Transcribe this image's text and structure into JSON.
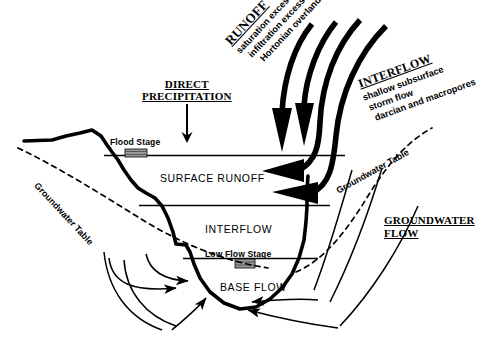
{
  "figure": {
    "colors": {
      "ink": "#000000",
      "background": "#ffffff",
      "marker_fill": "#9a9a9a"
    }
  },
  "headings": {
    "direct_precipitation": "DIRECT\nPRECIPITATION",
    "direct_precipitation_line1": "DIRECT",
    "direct_precipitation_line2": "PRECIPITATION",
    "runoff": "RUNOFF",
    "interflow": "INTERFLOW",
    "groundwater_flow_line1": "GROUNDWATER",
    "groundwater_flow_line2": "FLOW"
  },
  "runoff_mechanisms": [
    "saturation excess flow",
    "infiltration excess flow",
    "Hortonian overland flow"
  ],
  "interflow_mechanisms": [
    "shallow subsurface",
    "storm flow",
    "darcian and macropores"
  ],
  "zones": {
    "surface_runoff": "SURFACE RUNOFF",
    "interflow": "INTERFLOW",
    "base_flow": "BASE FLOW"
  },
  "stages": {
    "flood": "Flood Stage",
    "low_flow": "Low Flow Stage"
  },
  "water_table": {
    "left_label": "Groundwater Table",
    "right_label": "Groundwater Table"
  }
}
